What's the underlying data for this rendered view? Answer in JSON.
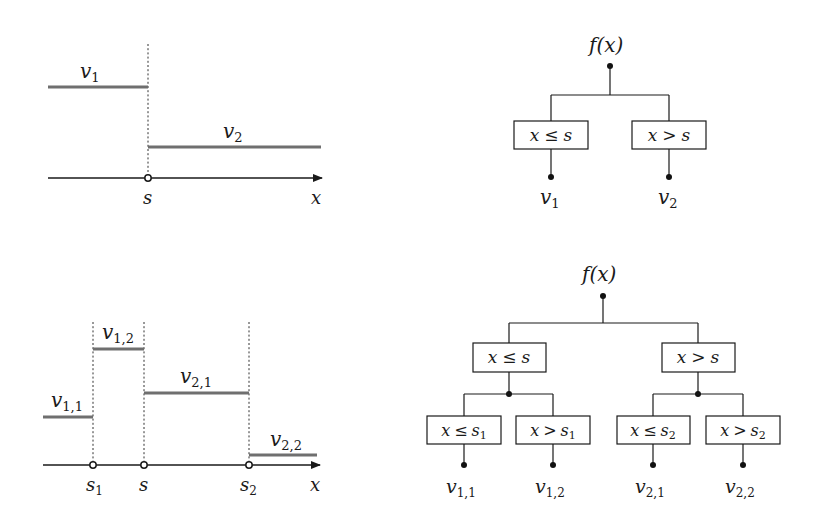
{
  "figure": {
    "top_left": {
      "name": "piecewise-constant-one-split",
      "labels": {
        "v1": "v",
        "v1_sub": "1",
        "v2": "v",
        "v2_sub": "2",
        "split": "s",
        "axis": "x"
      }
    },
    "top_right": {
      "name": "tree-one-split",
      "root": "f(x)",
      "nodes": [
        {
          "cond_left": "x",
          "op": "≤",
          "rhs": "s",
          "rhs_sub": ""
        },
        {
          "cond_left": "x",
          "op": ">",
          "rhs": "s",
          "rhs_sub": ""
        }
      ],
      "leaves": [
        {
          "v": "v",
          "sub": "1"
        },
        {
          "v": "v",
          "sub": "2"
        }
      ]
    },
    "bottom_left": {
      "name": "piecewise-constant-three-splits",
      "labels": {
        "v11": "v",
        "v11_sub": "1,1",
        "v12": "v",
        "v12_sub": "1,2",
        "v21": "v",
        "v21_sub": "2,1",
        "v22": "v",
        "v22_sub": "2,2",
        "s1": "s",
        "s1_sub": "1",
        "s": "s",
        "s2": "s",
        "s2_sub": "2",
        "axis": "x"
      }
    },
    "bottom_right": {
      "name": "tree-two-levels",
      "root": "f(x)",
      "level1": [
        {
          "cond_left": "x",
          "op": "≤",
          "rhs": "s",
          "rhs_sub": ""
        },
        {
          "cond_left": "x",
          "op": ">",
          "rhs": "s",
          "rhs_sub": ""
        }
      ],
      "level2": [
        {
          "cond_left": "x",
          "op": "≤",
          "rhs": "s",
          "rhs_sub": "1"
        },
        {
          "cond_left": "x",
          "op": ">",
          "rhs": "s",
          "rhs_sub": "1"
        },
        {
          "cond_left": "x",
          "op": "≤",
          "rhs": "s",
          "rhs_sub": "2"
        },
        {
          "cond_left": "x",
          "op": ">",
          "rhs": "s",
          "rhs_sub": "2"
        }
      ],
      "leaves": [
        {
          "v": "v",
          "sub": "1,1"
        },
        {
          "v": "v",
          "sub": "1,2"
        },
        {
          "v": "v",
          "sub": "2,1"
        },
        {
          "v": "v",
          "sub": "2,2"
        }
      ]
    }
  },
  "colors": {
    "step_line": "#6f6f6f",
    "ink": "#1a1a1a",
    "background": "#ffffff"
  }
}
